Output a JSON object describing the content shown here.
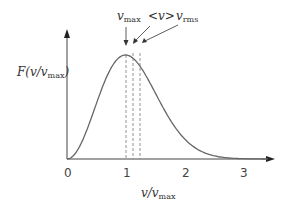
{
  "diagram": {
    "y_axis_label": "F(v/v",
    "y_axis_label_sub": "max",
    "y_axis_label_close": ")",
    "x_axis_label": "v/v",
    "x_axis_label_sub": "max",
    "x_ticks": [
      "0",
      "1",
      "2",
      "3"
    ],
    "markers": [
      {
        "label": "v",
        "sub": "max",
        "x_value": 1.0
      },
      {
        "label": "<v>",
        "sub": "",
        "x_value": 1.128
      },
      {
        "label": "v",
        "sub": "rms",
        "x_value": 1.225
      }
    ],
    "colors": {
      "curve": "#666666",
      "axes": "#444444",
      "dashed": "#777777"
    }
  },
  "chart_data": {
    "type": "line",
    "title": "",
    "xlabel": "v/v_max",
    "ylabel": "F(v/v_max)",
    "x_ticks": [
      0,
      1,
      2,
      3
    ],
    "xlim": [
      0,
      3.5
    ],
    "grid": false,
    "series": [
      {
        "name": "F(v/v_max)",
        "x": [
          0,
          0.25,
          0.5,
          0.75,
          1.0,
          1.25,
          1.5,
          1.75,
          2.0,
          2.25,
          2.5,
          2.75,
          3.0
        ],
        "values": [
          0,
          0.17,
          0.58,
          0.92,
          1.0,
          0.84,
          0.56,
          0.31,
          0.14,
          0.05,
          0.016,
          0.004,
          0.001
        ]
      }
    ],
    "annotations": [
      "v_max at 1.0",
      "<v> at 1.128",
      "v_rms at 1.225"
    ]
  }
}
